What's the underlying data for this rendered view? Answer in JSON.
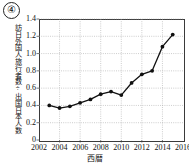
{
  "figure": {
    "item_number": "④"
  },
  "chart_data": {
    "type": "line",
    "title": "",
    "xlabel": "西暦",
    "ylabel": "訪日外国人旅行者数÷出国日本人数",
    "x": [
      2003,
      2004,
      2005,
      2006,
      2007,
      2008,
      2009,
      2010,
      2011,
      2012,
      2013,
      2014,
      2015
    ],
    "values": [
      0.4,
      0.37,
      0.39,
      0.43,
      0.47,
      0.53,
      0.56,
      0.52,
      0.66,
      0.76,
      0.8,
      1.08,
      1.22
    ],
    "xlim": [
      2002,
      2016
    ],
    "ylim": [
      0,
      1.4
    ],
    "xticks": [
      2002,
      2004,
      2006,
      2008,
      2010,
      2012,
      2014,
      2016
    ],
    "xtick_labels": [
      "2002",
      "2004",
      "2006",
      "2008",
      "2010",
      "2012",
      "2014",
      "2016"
    ],
    "yticks": [
      0,
      0.2,
      0.4,
      0.6,
      0.8,
      1.0,
      1.2,
      1.4
    ],
    "ytick_labels": [
      "0",
      "0.2",
      "0.4",
      "0.6",
      "0.8",
      "1.0",
      "1.2",
      "1.4"
    ],
    "grid": true,
    "legend": false,
    "line_color": "#111111",
    "marker": "circle",
    "marker_color": "#111111",
    "grid_color": "#9a9a9a",
    "axis_color": "#3a3a3a"
  }
}
